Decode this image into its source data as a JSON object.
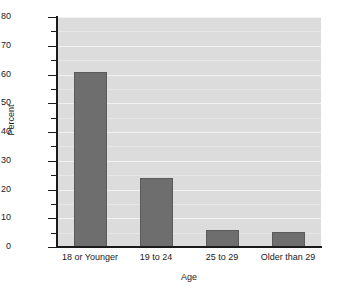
{
  "chart_data": {
    "type": "bar",
    "title": "",
    "subtitle": "",
    "xlabel": "Age",
    "ylabel": "Percent",
    "categories": [
      "18 or Younger",
      "19 to 24",
      "25 to 29",
      "Older than 29"
    ],
    "values": [
      61,
      24,
      6,
      5.3
    ],
    "series": [
      {
        "name": "Percent",
        "values": [
          61,
          24,
          6,
          5.3
        ]
      }
    ],
    "ylim": [
      0,
      80
    ],
    "xlim": [
      0,
      4
    ],
    "y_major_ticks": [
      0,
      10,
      20,
      30,
      40,
      50,
      60,
      70,
      80
    ],
    "y_minor_ticks": [
      5,
      15,
      25,
      35,
      45,
      55,
      65,
      75
    ],
    "y_tick_labels": [
      "0",
      "10",
      "20",
      "30",
      "40",
      "50",
      "60",
      "70",
      "80"
    ],
    "grid": true,
    "grid_axis": "y",
    "legend": false,
    "legend_position": "none",
    "bar_color": "#6e6e6e",
    "bar_edge_color": "#5a5a5a",
    "plot_background": "#dcdcdc",
    "figure_background": "#ffffff",
    "gridline_color": "#f2f2f2",
    "axis_color": "#1a1a1a",
    "text_color": "#1a1a1a",
    "bar_width_ratio": 0.5
  }
}
